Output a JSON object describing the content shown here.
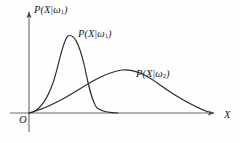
{
  "figure": {
    "axes": {
      "y_axis_title": "P(X|ω1)",
      "y_axis_title_base": "P(X|ω",
      "y_axis_title_sub": "1",
      "y_axis_title_close": ")",
      "x_axis_title": "X",
      "origin_label": "O"
    },
    "curve_labels": {
      "curve1_base": "P(X|ω",
      "curve1_sub": "1",
      "curve1_close": ")",
      "curve2_base": "P(X|ω",
      "curve2_sub": "2",
      "curve2_close": ")"
    },
    "colors": {
      "curve": "#2b2b2b",
      "axis": "#555555",
      "text": "#1a1a1a",
      "background": "#fefefe"
    }
  },
  "chart_data": {
    "type": "line",
    "title": "",
    "xlabel": "X",
    "ylabel": "P(X|ω1)",
    "grid": false,
    "legend": "inline-annotations",
    "xlim": [
      0,
      1
    ],
    "ylim": [
      0,
      1
    ],
    "axis_pixel_geometry": {
      "origin_x": 29,
      "baseline_y": 113,
      "x_axis_end": 218,
      "y_axis_top": 8,
      "y_axis_bottom": 132
    },
    "series": [
      {
        "name": "P(X|ω1)",
        "annotation": "P(X|ω1)",
        "description": "Narrow, tall, left-shifted unimodal density with steep rise and steep fall",
        "peak_x": 0.21,
        "peak_y": 0.87,
        "x": [
          0.0,
          0.04,
          0.08,
          0.12,
          0.15,
          0.18,
          0.21,
          0.24,
          0.27,
          0.3,
          0.33,
          0.36,
          0.4,
          0.45,
          0.5,
          0.6,
          0.75,
          1.0
        ],
        "y": [
          0.0,
          0.03,
          0.1,
          0.34,
          0.63,
          0.82,
          0.87,
          0.86,
          0.76,
          0.54,
          0.31,
          0.15,
          0.06,
          0.02,
          0.01,
          0.0,
          0.0,
          0.0
        ],
        "pixel_path": "M 29,113 C 38,112 46,104 54,80 C 60,60 63,40 68,36 C 74,33 79,44 84,64 C 88,82 91,100 97,108 C 103,112 110,113 118,113"
      },
      {
        "name": "P(X|ω2)",
        "annotation": "P(X|ω2)",
        "description": "Broad, lower, right-shifted unimodal density with a long right tail",
        "peak_x": 0.5,
        "peak_y": 0.43,
        "x": [
          0.0,
          0.08,
          0.16,
          0.25,
          0.33,
          0.42,
          0.5,
          0.58,
          0.66,
          0.74,
          0.82,
          0.9,
          0.96,
          1.0
        ],
        "y": [
          0.0,
          0.07,
          0.15,
          0.24,
          0.33,
          0.4,
          0.43,
          0.42,
          0.37,
          0.29,
          0.2,
          0.11,
          0.04,
          0.0
        ],
        "pixel_path": "M 29,113 C 45,109 62,100 78,90 C 94,80 108,72 122,70 C 136,69 148,76 160,85 C 174,95 190,105 208,112"
      }
    ],
    "annotations": [
      {
        "text": "P(X|ω1)",
        "role": "y-axis-title",
        "x_px": 34,
        "y_px": 5
      },
      {
        "text": "P(X|ω1)",
        "role": "curve1-label",
        "x_px": 78,
        "y_px": 29
      },
      {
        "text": "P(X|ω2)",
        "role": "curve2-label",
        "x_px": 136,
        "y_px": 69
      },
      {
        "text": "O",
        "role": "origin-label",
        "x_px": 19,
        "y_px": 115
      },
      {
        "text": "X",
        "role": "x-axis-title",
        "x_px": 224,
        "y_px": 110
      }
    ]
  }
}
